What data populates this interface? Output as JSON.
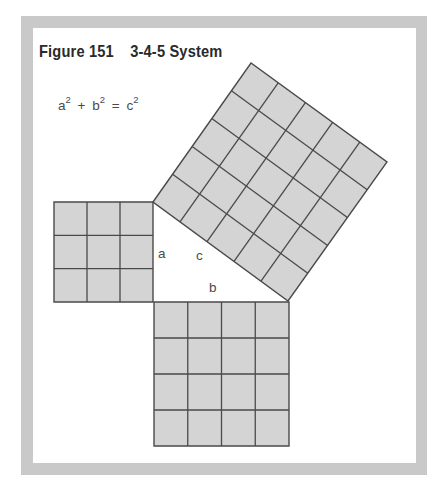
{
  "figure": {
    "number_label": "Figure 151",
    "title": "3-4-5 System"
  },
  "formula": {
    "terms": [
      {
        "base": "a",
        "exp": "2"
      },
      {
        "base": "b",
        "exp": "2"
      },
      {
        "base": "c",
        "exp": "2"
      }
    ],
    "plus": "+",
    "equals": "="
  },
  "triangle": {
    "labels": {
      "a": "a",
      "b": "b",
      "c": "c"
    },
    "sides": {
      "a": 3,
      "b": 4,
      "c": 5
    }
  },
  "squares": [
    {
      "name": "square-a",
      "grid": 3,
      "vertices": [
        [
          54,
          202
        ],
        [
          153,
          202
        ],
        [
          153,
          302
        ],
        [
          54,
          302
        ]
      ]
    },
    {
      "name": "square-b",
      "grid": 4,
      "vertices": [
        [
          154,
          302
        ],
        [
          289,
          302
        ],
        [
          289,
          446
        ],
        [
          154,
          446
        ]
      ]
    },
    {
      "name": "square-c",
      "grid": 5,
      "vertices": [
        [
          153,
          202
        ],
        [
          251,
          63
        ],
        [
          387,
          162
        ],
        [
          288,
          301
        ]
      ]
    }
  ],
  "colors": {
    "frame": "#c9c9c9",
    "fill": "#d4d4d4",
    "line": "#4a4a4a",
    "text": "#2a2a2a"
  }
}
